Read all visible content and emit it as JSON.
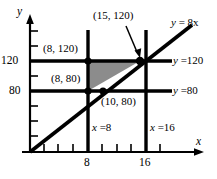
{
  "figure": {
    "type": "cartesian-graph",
    "axes": {
      "x_axis_label": "x",
      "y_axis_label": "y",
      "x_ticks_labeled": [
        "8",
        "16"
      ],
      "y_ticks_labeled": [
        "120",
        "80"
      ]
    },
    "point_labels": {
      "p_15_120": "(15, 120)",
      "p_8_120": "(8, 120)",
      "p_8_80": "(8, 80)",
      "p_10_80": "(10, 80)"
    },
    "line_labels": {
      "diagonal": "y = 8x",
      "horizontal_top": "y =120",
      "horizontal_bottom": "y =80",
      "vertical_left": "x =8",
      "vertical_right": "x =16"
    },
    "colors": {
      "ink": "#000000",
      "shading": "#8c8c8c",
      "background": "#ffffff"
    }
  },
  "chart_data": {
    "type": "line",
    "title": "",
    "xlabel": "x",
    "ylabel": "y",
    "xlim": [
      0,
      18
    ],
    "ylim": [
      0,
      160
    ],
    "grid": false,
    "xticks": [
      0,
      2,
      4,
      6,
      8,
      10,
      12,
      14,
      16
    ],
    "xticklabels": [
      "",
      "",
      "",
      "",
      "8",
      "",
      "",
      "",
      "16"
    ],
    "yticks": [
      0,
      20,
      40,
      60,
      80,
      100,
      120,
      140
    ],
    "yticklabels": [
      "",
      "",
      "",
      "",
      "80",
      "",
      "120",
      ""
    ],
    "series": [
      {
        "name": "y = 8x",
        "type": "line",
        "x": [
          0,
          18
        ],
        "y": [
          0,
          144
        ],
        "slope": 8,
        "intercept": 0
      },
      {
        "name": "y =120",
        "type": "hline",
        "y": 120,
        "x": [
          8,
          18
        ]
      },
      {
        "name": "y =80",
        "type": "hline",
        "y": 80,
        "x": [
          8,
          18
        ]
      },
      {
        "name": "x =8",
        "type": "vline",
        "x": 8,
        "y": [
          0,
          150
        ]
      },
      {
        "name": "x =16",
        "type": "vline",
        "x": 16,
        "y": [
          0,
          150
        ]
      }
    ],
    "shaded_region": {
      "label": "feasible-region",
      "vertices": [
        [
          8,
          120
        ],
        [
          8,
          80
        ],
        [
          15,
          120
        ]
      ],
      "fill": "#8c8c8c"
    },
    "annotations": [
      {
        "text": "(15, 120)",
        "point": [
          15,
          120
        ],
        "arrow": true
      },
      {
        "text": "(8, 120)",
        "point": [
          8,
          120
        ],
        "arrow": false
      },
      {
        "text": "(8, 80)",
        "point": [
          8,
          80
        ],
        "arrow": false
      },
      {
        "text": "(10, 80)",
        "point": [
          10,
          80
        ],
        "arrow": false
      }
    ],
    "marked_points": [
      [
        8,
        120
      ],
      [
        8,
        80
      ],
      [
        10,
        80
      ],
      [
        15,
        120
      ]
    ]
  }
}
